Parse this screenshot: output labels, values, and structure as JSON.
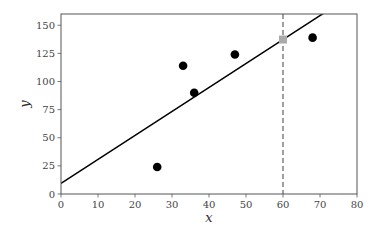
{
  "chart_data": {
    "type": "scatter",
    "title": "",
    "xlabel": "x",
    "ylabel": "y",
    "xlim": [
      0,
      80
    ],
    "ylim": [
      0,
      160
    ],
    "xticks": [
      0,
      10,
      20,
      30,
      40,
      50,
      60,
      70,
      80
    ],
    "yticks": [
      0,
      25,
      50,
      75,
      100,
      125,
      150
    ],
    "grid": false,
    "legend": null,
    "series": [
      {
        "name": "observations",
        "kind": "scatter",
        "marker": "circle",
        "color": "#000000",
        "points": [
          {
            "x": 26,
            "y": 24
          },
          {
            "x": 33,
            "y": 114
          },
          {
            "x": 36,
            "y": 90
          },
          {
            "x": 47,
            "y": 124
          },
          {
            "x": 68,
            "y": 139
          }
        ]
      },
      {
        "name": "regression-line",
        "kind": "line",
        "color": "#000000",
        "intercept": 9.5,
        "slope": 2.13
      },
      {
        "name": "prediction",
        "kind": "scatter",
        "marker": "square",
        "color": "#aaaaaa",
        "points": [
          {
            "x": 60,
            "y": 137.3
          }
        ]
      },
      {
        "name": "query-line",
        "kind": "vline",
        "style": "dashed",
        "color": "#777777",
        "x": 60
      }
    ]
  }
}
